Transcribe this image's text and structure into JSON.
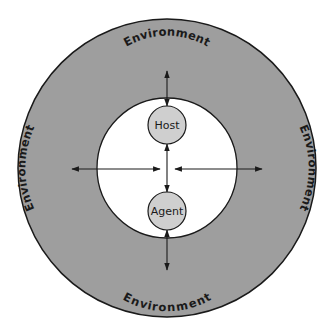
{
  "diagram": {
    "outer_ring": {
      "label": "Environment",
      "fill": "#9e9e9e",
      "stroke": "#1a1a1a"
    },
    "inner_area": {
      "fill": "#ffffff",
      "stroke": "#1a1a1a"
    },
    "labels": {
      "top": "Environment",
      "bottom": "Environment",
      "left": "Environment",
      "right": "Environment"
    },
    "nodes": [
      {
        "id": "host",
        "label": "Host",
        "fill": "#cfcfcf"
      },
      {
        "id": "agent",
        "label": "Agent",
        "fill": "#cfcfcf"
      }
    ],
    "edges": [
      {
        "from": "host",
        "to": "environment-top",
        "direction": "bidirectional"
      },
      {
        "from": "agent",
        "to": "environment-bottom",
        "direction": "bidirectional"
      },
      {
        "from": "center",
        "to": "environment-left",
        "direction": "bidirectional"
      },
      {
        "from": "center",
        "to": "environment-right",
        "direction": "bidirectional"
      },
      {
        "from": "host",
        "to": "agent",
        "direction": "bidirectional"
      }
    ]
  }
}
